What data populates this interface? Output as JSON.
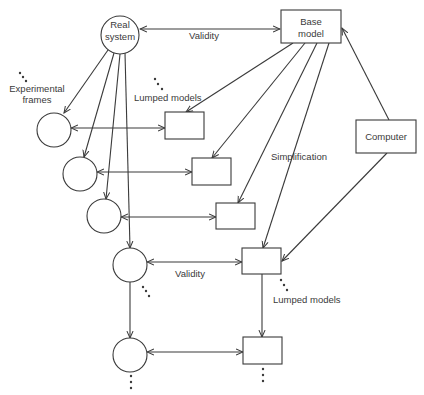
{
  "diagram": {
    "nodes": {
      "real_system": {
        "line1": "Real",
        "line2": "system"
      },
      "base_model": {
        "line1": "Base",
        "line2": "model"
      },
      "computer": {
        "label": "Computer"
      }
    },
    "labels": {
      "validity_top": "Validity",
      "validity_bottom": "Validity",
      "experimental_frames_1": "Experimental",
      "experimental_frames_2": "frames",
      "lumped_models_top": "Lumped models",
      "lumped_models_bottom": "Lumped models",
      "simplification": "Simplification"
    },
    "experimental_frames": [
      {
        "cx": 54,
        "cy": 130
      },
      {
        "cx": 80,
        "cy": 174
      },
      {
        "cx": 104,
        "cy": 216
      },
      {
        "cx": 130,
        "cy": 265
      },
      {
        "cx": 130,
        "cy": 355
      }
    ],
    "lumped_models": [
      {
        "x": 165,
        "y": 112
      },
      {
        "x": 192,
        "y": 158
      },
      {
        "x": 216,
        "y": 203
      },
      {
        "x": 242,
        "y": 248
      },
      {
        "x": 243,
        "y": 337
      }
    ],
    "colors": {
      "stroke": "#3a3a3a",
      "background": "#ffffff"
    }
  }
}
